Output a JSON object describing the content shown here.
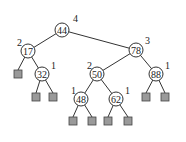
{
  "diagram": {
    "type": "AVL tree with heights",
    "nodes": [
      {
        "id": "n44",
        "key": "44",
        "height": "4",
        "x": 62,
        "y": 30,
        "lx": 73,
        "ly": 19
      },
      {
        "id": "n17",
        "key": "17",
        "height": "2",
        "x": 28,
        "y": 51,
        "lx": 17,
        "ly": 43
      },
      {
        "id": "n78",
        "key": "78",
        "height": "3",
        "x": 136,
        "y": 50,
        "lx": 145,
        "ly": 41
      },
      {
        "id": "n32",
        "key": "32",
        "height": "1",
        "x": 42,
        "y": 74,
        "lx": 51,
        "ly": 66
      },
      {
        "id": "n50",
        "key": "50",
        "height": "2",
        "x": 97,
        "y": 74,
        "lx": 87,
        "ly": 66
      },
      {
        "id": "n88",
        "key": "88",
        "height": "1",
        "x": 156,
        "y": 74,
        "lx": 165,
        "ly": 66
      },
      {
        "id": "n48",
        "key": "48",
        "height": "1",
        "x": 81,
        "y": 99,
        "lx": 71,
        "ly": 91
      },
      {
        "id": "n62",
        "key": "62",
        "height": "1",
        "x": 116,
        "y": 99,
        "lx": 125,
        "ly": 91
      }
    ],
    "leaves": [
      {
        "x": 18,
        "y": 74
      },
      {
        "x": 36,
        "y": 97
      },
      {
        "x": 53,
        "y": 97
      },
      {
        "x": 73,
        "y": 121
      },
      {
        "x": 92,
        "y": 121
      },
      {
        "x": 108,
        "y": 121
      },
      {
        "x": 128,
        "y": 121
      },
      {
        "x": 146,
        "y": 97
      },
      {
        "x": 165,
        "y": 97
      }
    ],
    "edges": [
      [
        "n44",
        "n17"
      ],
      [
        "n44",
        "n78"
      ],
      [
        "n17",
        "L0"
      ],
      [
        "n17",
        "n32"
      ],
      [
        "n32",
        "L1"
      ],
      [
        "n32",
        "L2"
      ],
      [
        "n78",
        "n50"
      ],
      [
        "n78",
        "n88"
      ],
      [
        "n50",
        "n48"
      ],
      [
        "n50",
        "n62"
      ],
      [
        "n48",
        "L3"
      ],
      [
        "n48",
        "L4"
      ],
      [
        "n62",
        "L5"
      ],
      [
        "n62",
        "L6"
      ],
      [
        "n88",
        "L7"
      ],
      [
        "n88",
        "L8"
      ]
    ]
  }
}
